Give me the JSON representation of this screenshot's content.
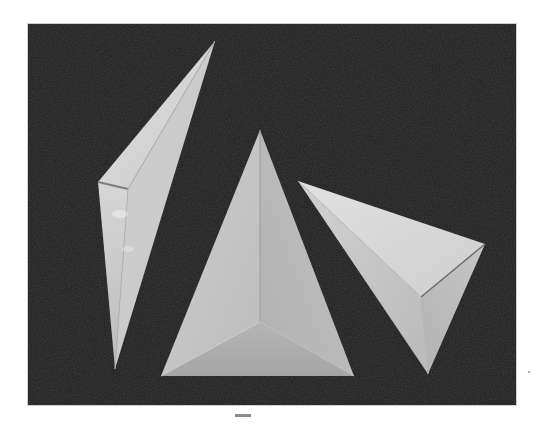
{
  "figure": {
    "caption": "",
    "colors": {
      "page_background": "#ffffff",
      "photo_background": "#1c1c1c",
      "paper_light": "#d9d9d9",
      "paper_mid": "#bdbdbd",
      "paper_shadow": "#a8a8a8",
      "fold_line": "#8c8c8c",
      "caption_bar": "#8d8d8d"
    },
    "objects": [
      {
        "name": "left-pyramid",
        "shape": "elongated tetrahedron, apex upper-right, tip at bottom"
      },
      {
        "name": "center-pyramid",
        "shape": "tetrahedron viewed from above, apex at top, triangular base"
      },
      {
        "name": "right-pyramid",
        "shape": "tetrahedron lying on side, tip pointing down"
      }
    ]
  }
}
